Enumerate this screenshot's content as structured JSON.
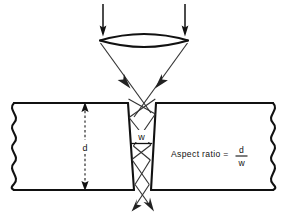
{
  "figure": {
    "title": "Laser beam focusing and kerf aspect ratio",
    "background_color": "#ffffff",
    "line_color": "#111111",
    "ray_color": "#333333",
    "dimension_color": "#555555"
  },
  "labels": {
    "depth": "d",
    "width": "w",
    "formula_lead": "Aspect ratio =",
    "formula_numerator": "d",
    "formula_denominator": "w"
  },
  "icons": {
    "beam_in_left": "down-arrow-icon",
    "beam_in_right": "down-arrow-icon",
    "converging_ray_left": "down-right-arrow-icon",
    "converging_ray_right": "down-left-arrow-icon",
    "exit_ray_left": "down-left-arrow-icon",
    "exit_ray_right": "down-right-arrow-icon",
    "depth_arrow_top": "up-arrow-icon",
    "depth_arrow_bottom": "down-arrow-icon",
    "lens": "biconvex-lens-icon",
    "break_left": "wavy-break-line-icon",
    "break_right": "wavy-break-line-icon"
  },
  "geometry": {
    "lens": {
      "left_x": 100,
      "right_x": 188,
      "center_y": 40,
      "top_bulge_y": 31,
      "bottom_bulge_y": 49
    },
    "beam_in": {
      "left_x": 103,
      "right_x": 185,
      "top_y": 3,
      "bottom_y": 33
    },
    "workpiece": {
      "top_y": 103,
      "bottom_y": 190,
      "left_edge_x": 10,
      "right_edge_x": 277,
      "kerf_top_left_x": 128,
      "kerf_top_right_x": 156,
      "kerf_bottom_left_x": 134,
      "kerf_bottom_right_x": 151
    },
    "depth_dimension_x": 85,
    "width_dimension_y": 143
  }
}
